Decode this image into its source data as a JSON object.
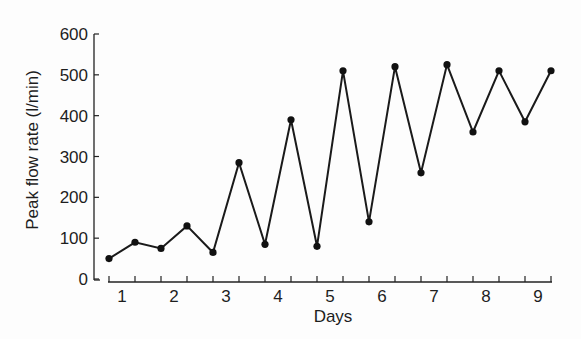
{
  "chart_data": {
    "type": "line",
    "title": "",
    "xlabel": "Days",
    "ylabel": "Peak flow rate (l/min)",
    "ylim": [
      0,
      600
    ],
    "yticks": [
      0,
      100,
      200,
      300,
      400,
      500,
      600
    ],
    "day_labels": [
      "1",
      "2",
      "3",
      "4",
      "5",
      "6",
      "7",
      "8",
      "9"
    ],
    "grid": false,
    "legend": null,
    "series": [
      {
        "name": "Peak flow rate",
        "color": "#1a1a1a",
        "marker": "circle",
        "x": [
          1,
          2,
          3,
          4,
          5,
          6,
          7,
          8,
          9,
          10,
          11,
          12,
          13,
          14,
          15,
          16,
          17,
          18
        ],
        "day": [
          1,
          1,
          2,
          2,
          3,
          3,
          4,
          4,
          5,
          5,
          6,
          6,
          7,
          7,
          8,
          8,
          9,
          9
        ],
        "values": [
          50,
          90,
          75,
          130,
          65,
          285,
          85,
          390,
          80,
          510,
          140,
          520,
          260,
          525,
          360,
          510,
          385,
          510
        ]
      }
    ]
  },
  "labels": {
    "xlabel": "Days",
    "ylabel": "Peak flow rate (l/min)"
  }
}
